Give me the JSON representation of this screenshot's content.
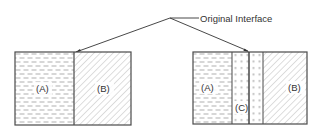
{
  "diagram": {
    "callout_label": "Original Interface",
    "left_panel": {
      "region_a_label": "(A)",
      "region_b_label": "(B)"
    },
    "right_panel": {
      "region_a_label": "(A)",
      "region_c_label": "(C)",
      "region_b_label": "(B)"
    },
    "colors": {
      "outline": "#4a4a4a",
      "pattern": "#b8b8b8",
      "leader_line": "#333333",
      "background": "#ffffff"
    }
  }
}
